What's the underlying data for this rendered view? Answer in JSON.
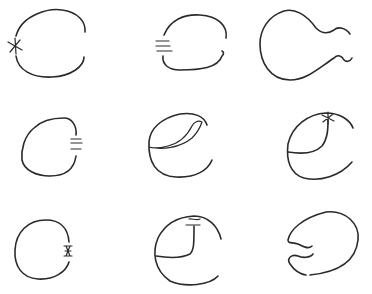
{
  "diagram": {
    "type": "sketch-grid",
    "rows": 3,
    "columns": 3,
    "stroke_color": "#2a2a2a",
    "background": "#ffffff",
    "panels": [
      {
        "row": 1,
        "col": 1,
        "shape": "open-circle-right-gap",
        "mark": "asterisk",
        "mark_position": "left"
      },
      {
        "row": 1,
        "col": 2,
        "shape": "open-circle-left-gap",
        "mark": "triple-bar",
        "mark_position": "left"
      },
      {
        "row": 1,
        "col": 3,
        "shape": "bulb-with-wavy-neck",
        "mark": "none",
        "mark_position": "right"
      },
      {
        "row": 2,
        "col": 1,
        "shape": "open-circle-right-gap",
        "mark": "triple-bar",
        "mark_position": "right"
      },
      {
        "row": 2,
        "col": 2,
        "shape": "open-circle-with-leaf-fold",
        "mark": "none",
        "mark_position": "top"
      },
      {
        "row": 2,
        "col": 3,
        "shape": "open-circle-with-inner-curve",
        "mark": "asterisk",
        "mark_position": "top"
      },
      {
        "row": 3,
        "col": 1,
        "shape": "open-circle-right-gap",
        "mark": "hourglass-asterisk",
        "mark_position": "right"
      },
      {
        "row": 3,
        "col": 2,
        "shape": "open-circle-with-inner-corner",
        "mark": "double-bar-squiggle",
        "mark_position": "top"
      },
      {
        "row": 3,
        "col": 3,
        "shape": "rounded-body-with-wavy-mouth",
        "mark": "none",
        "mark_position": "left"
      }
    ]
  }
}
